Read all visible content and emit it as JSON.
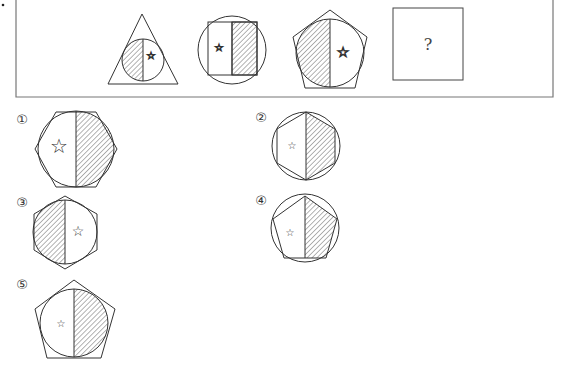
{
  "question": {
    "sequence": [
      {
        "id": "fig1",
        "outer": "triangle",
        "inner": "circle",
        "hatched_half": "left",
        "star_half": "right"
      },
      {
        "id": "fig2",
        "outer": "circle",
        "inner": "rectangle",
        "hatched_half": "right",
        "star_half": "left"
      },
      {
        "id": "fig3",
        "outer": "pentagon",
        "inner": "circle",
        "hatched_half": "left",
        "star_half": "right"
      },
      {
        "id": "fig4",
        "outer": "square",
        "content": "?"
      }
    ],
    "placeholder": "?"
  },
  "options": [
    {
      "label": "①",
      "outer": "hexagon",
      "inner": "circle",
      "hatched_half": "right",
      "star_half": "left"
    },
    {
      "label": "②",
      "outer": "circle",
      "inner": "hexagon",
      "hatched_half": "right",
      "star_half": "left"
    },
    {
      "label": "③",
      "outer": "hexagon",
      "inner": "circle",
      "hatched_half": "left",
      "star_half": "right"
    },
    {
      "label": "④",
      "outer": "circle",
      "inner": "pentagon",
      "hatched_half": "right",
      "star_half": "left"
    },
    {
      "label": "⑤",
      "outer": "pentagon",
      "inner": "circle",
      "hatched_half": "right",
      "star_half": "left"
    }
  ],
  "icons": {
    "star": "☆"
  },
  "colors": {
    "stroke": "#333333",
    "frame": "#777777",
    "background": "#ffffff"
  }
}
